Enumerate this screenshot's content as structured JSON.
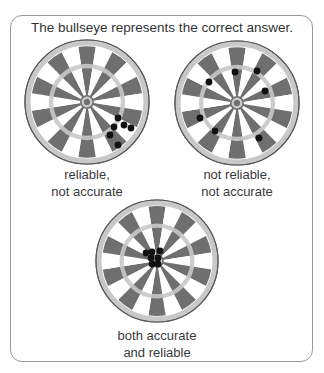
{
  "title": "The bullseye represents the correct answer.",
  "colors": {
    "dark": "#6f6f6f",
    "light": "#ffffff",
    "ring": "#c8c8c8",
    "rim": "#5a5a5a",
    "dot": "#111111",
    "border": "#9a9a9a"
  },
  "segments": 20,
  "targets": [
    {
      "id": "reliable-not-accurate",
      "center": [
        87,
        102
      ],
      "radius": 62,
      "caption": [
        "reliable,",
        "not accurate"
      ],
      "caption_pos": [
        20,
        164,
        134
      ],
      "dots": [
        [
          118,
          118
        ],
        [
          114,
          127
        ],
        [
          124,
          125
        ],
        [
          131,
          128
        ],
        [
          110,
          135
        ],
        [
          118,
          145
        ]
      ]
    },
    {
      "id": "not-reliable-not-accurate",
      "center": [
        237,
        103
      ],
      "radius": 62,
      "caption": [
        "not reliable,",
        "not accurate"
      ],
      "caption_pos": [
        170,
        164,
        134
      ],
      "dots": [
        [
          235,
          72
        ],
        [
          257,
          71
        ],
        [
          209,
          82
        ],
        [
          265,
          91
        ],
        [
          200,
          118
        ],
        [
          215,
          131
        ],
        [
          259,
          138
        ]
      ]
    },
    {
      "id": "accurate-and-reliable",
      "center": [
        157,
        261
      ],
      "radius": 61,
      "caption": [
        "both accurate",
        "and reliable"
      ],
      "caption_pos": [
        95,
        326,
        124
      ],
      "dots": [
        [
          146,
          253
        ],
        [
          152,
          252
        ],
        [
          160,
          251
        ],
        [
          151,
          258
        ],
        [
          158,
          258
        ],
        [
          152,
          264
        ],
        [
          158,
          264
        ]
      ]
    }
  ]
}
